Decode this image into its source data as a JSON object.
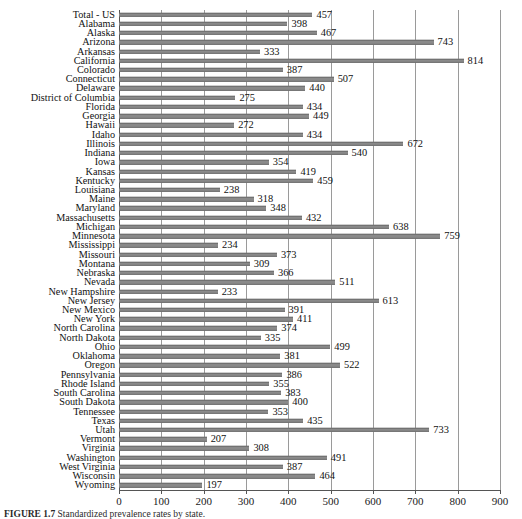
{
  "chart_data": {
    "type": "bar",
    "orientation": "horizontal",
    "title": "",
    "xlabel": "",
    "ylabel": "",
    "xlim": [
      0,
      900
    ],
    "xticks": [
      0,
      100,
      200,
      300,
      400,
      500,
      600,
      700,
      800,
      900
    ],
    "grid": "vertical",
    "legend": "none",
    "bar_color": "#8a8a8a",
    "categories": [
      "Total - US",
      "Alabama",
      "Alaska",
      "Arizona",
      "Arkansas",
      "California",
      "Colorado",
      "Connecticut",
      "Delaware",
      "District of Columbia",
      "Florida",
      "Georgia",
      "Hawaii",
      "Idaho",
      "Illinois",
      "Indiana",
      "Iowa",
      "Kansas",
      "Kentucky",
      "Louisiana",
      "Maine",
      "Maryland",
      "Massachusetts",
      "Michigan",
      "Minnesota",
      "Mississippi",
      "Missouri",
      "Montana",
      "Nebraska",
      "Nevada",
      "New Hampshire",
      "New Jersey",
      "New Mexico",
      "New York",
      "North Carolina",
      "North Dakota",
      "Ohio",
      "Oklahoma",
      "Oregon",
      "Pennsylvania",
      "Rhode Island",
      "South Carolina",
      "South Dakota",
      "Tennessee",
      "Texas",
      "Utah",
      "Vermont",
      "Virginia",
      "Washington",
      "West Virginia",
      "Wisconsin",
      "Wyoming"
    ],
    "values": [
      457,
      398,
      467,
      743,
      333,
      814,
      387,
      507,
      440,
      275,
      434,
      449,
      272,
      434,
      672,
      540,
      354,
      419,
      459,
      238,
      318,
      348,
      432,
      638,
      759,
      234,
      373,
      309,
      366,
      511,
      233,
      613,
      391,
      411,
      374,
      335,
      499,
      381,
      522,
      386,
      355,
      383,
      400,
      353,
      435,
      733,
      207,
      308,
      491,
      387,
      464,
      197
    ]
  },
  "caption": {
    "figure_label": "FIGURE 1.7",
    "text": "Standardized prevalence rates by state."
  }
}
